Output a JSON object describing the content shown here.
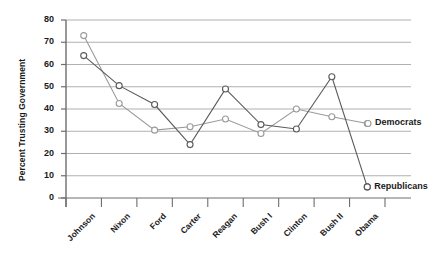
{
  "chart_data": {
    "type": "line",
    "title": "",
    "xlabel": "",
    "ylabel": "Percent Trusting Government",
    "categories": [
      "Johnson",
      "Nixon",
      "Ford",
      "Carter",
      "Reagan",
      "Bush I",
      "Clinton",
      "Bush II",
      "Obama"
    ],
    "ylim": [
      0,
      80
    ],
    "yticks": [
      0,
      10,
      20,
      30,
      40,
      50,
      60,
      70,
      80
    ],
    "grid": true,
    "legend_position": "right-inline",
    "series": [
      {
        "name": "Democrats",
        "color": "#9a9a9a",
        "marker": "open-circle",
        "values": [
          73,
          42.5,
          30.5,
          32,
          35.5,
          29,
          40,
          36.5,
          33.5
        ]
      },
      {
        "name": "Republicans",
        "color": "#5a5a5a",
        "marker": "open-circle",
        "values": [
          64,
          50.5,
          42,
          24,
          49,
          33,
          31,
          54.5,
          5
        ]
      }
    ]
  },
  "legend": {
    "democrats_label": "Democrats",
    "republicans_label": "Republicans"
  },
  "colors": {
    "grid": "#b0b0b0",
    "axis": "#6e6e6e",
    "text": "#1a1a1a",
    "background": "#ffffff"
  }
}
